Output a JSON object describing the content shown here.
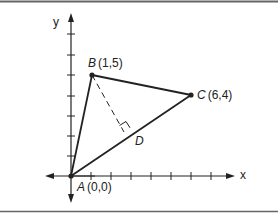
{
  "diagram": {
    "type": "coordinate-geometry",
    "axes": {
      "x_label": "x",
      "y_label": "y"
    },
    "points": [
      {
        "name": "A",
        "coords": "(0,0)",
        "x": 0,
        "y": 0
      },
      {
        "name": "B",
        "coords": "(1,5)",
        "x": 1,
        "y": 5
      },
      {
        "name": "C",
        "coords": "(6,4)",
        "x": 6,
        "y": 4
      },
      {
        "name": "D",
        "coords": "",
        "note": "foot of perpendicular from B to AC"
      }
    ],
    "segments": [
      {
        "from": "A",
        "to": "B",
        "style": "solid"
      },
      {
        "from": "B",
        "to": "C",
        "style": "solid"
      },
      {
        "from": "A",
        "to": "C",
        "style": "solid"
      },
      {
        "from": "B",
        "to": "D",
        "style": "dashed",
        "right_angle_at": "D"
      }
    ],
    "colors": {
      "line": "#222222",
      "border": "#666666",
      "background": "#ffffff"
    }
  },
  "labels": {
    "x_axis": "x",
    "y_axis": "y",
    "A_name": "A",
    "A_coords": "(0,0)",
    "B_name": "B",
    "B_coords": "(1,5)",
    "C_name": "C",
    "C_coords": "(6,4)",
    "D_name": "D"
  }
}
